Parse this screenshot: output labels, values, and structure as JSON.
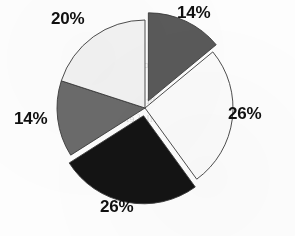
{
  "figure": {
    "background_color": "#fdfdfd",
    "label_color": "#101010"
  },
  "bleed_through": {
    "visible": true,
    "color": "#cfcfcf",
    "lines": [
      "onnis etnelav",
      "era lanoitan ro",
      "eht a stejorp",
      "gnillaf elbat",
      "a si siht",
      "sdnuf eht"
    ]
  },
  "labels": {
    "top_right": "14%",
    "right": "26%",
    "bottom": "26%",
    "left": "14%",
    "top_left": "20%"
  },
  "chart_data": {
    "type": "pie",
    "title": "",
    "xlabel": "",
    "ylabel": "",
    "legend_position": "none",
    "grid": false,
    "labels_shown": true,
    "label_format": "percent",
    "start_angle_deg": -90,
    "direction": "clockwise",
    "total_percent": 100,
    "categories": [
      "Slice 1",
      "Slice 2",
      "Slice 3",
      "Slice 4",
      "Slice 5"
    ],
    "values": [
      14,
      26,
      26,
      14,
      20
    ],
    "value_labels": [
      "14%",
      "26%",
      "26%",
      "14%",
      "20%"
    ],
    "colors": [
      "#5a5a5a",
      "#fbfbfb",
      "#141414",
      "#6b6b6b",
      "#f2f2f2"
    ],
    "edge_color": "#3a3a3a",
    "explode": [
      0.09,
      0,
      0.09,
      0,
      0
    ],
    "slices": [
      {
        "label": "14%",
        "value": 14,
        "color": "#5a5a5a",
        "color_name": "dark-gray",
        "exploded": true,
        "label_position": "top-right"
      },
      {
        "label": "26%",
        "value": 26,
        "color": "#fbfbfb",
        "color_name": "white",
        "exploded": false,
        "label_position": "right"
      },
      {
        "label": "26%",
        "value": 26,
        "color": "#141414",
        "color_name": "black",
        "exploded": true,
        "label_position": "bottom"
      },
      {
        "label": "14%",
        "value": 14,
        "color": "#6b6b6b",
        "color_name": "medium-gray",
        "exploded": false,
        "label_position": "left"
      },
      {
        "label": "20%",
        "value": 20,
        "color": "#f2f2f2",
        "color_name": "off-white",
        "exploded": false,
        "label_position": "top-left"
      }
    ]
  }
}
